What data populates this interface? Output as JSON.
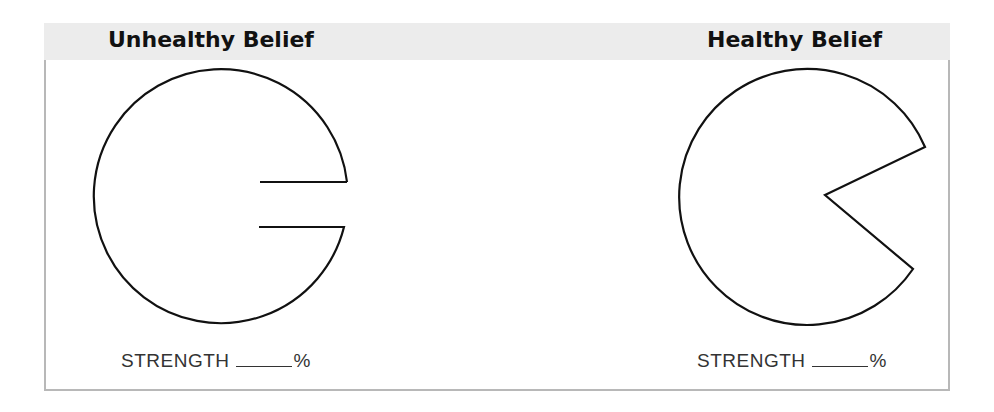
{
  "panels": [
    {
      "title": "Unhealthy Belief",
      "strength_label": "STRENGTH",
      "strength_value": "",
      "strength_unit": "%",
      "shape": "circle with narrow rectangular slot cut from the right side"
    },
    {
      "title": "Healthy Belief",
      "strength_label": "STRENGTH",
      "strength_value": "",
      "strength_unit": "%",
      "shape": "circle with wedge (pie slice) removed on the right side"
    }
  ],
  "colors": {
    "header_band": "#ececec",
    "border": "#b8b8b8",
    "stroke": "#111111"
  }
}
